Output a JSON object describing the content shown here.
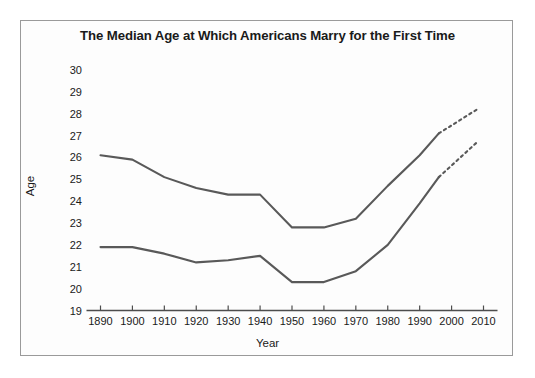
{
  "chart_data": {
    "type": "line",
    "title": "The Median Age at Which Americans Marry for the First Time",
    "xlabel": "Year",
    "ylabel": "Age",
    "xlim": [
      1890,
      2010
    ],
    "ylim": [
      19,
      30
    ],
    "xticks": [
      1890,
      1900,
      1910,
      1920,
      1930,
      1940,
      1950,
      1960,
      1970,
      1980,
      1990,
      2000,
      2010
    ],
    "yticks": [
      19,
      20,
      21,
      22,
      23,
      24,
      25,
      26,
      27,
      28,
      29,
      30
    ],
    "grid": false,
    "legend": "none",
    "line_color": "#595959",
    "series": [
      {
        "name": "men",
        "solid": {
          "x": [
            1890,
            1900,
            1910,
            1920,
            1930,
            1940,
            1950,
            1960,
            1970,
            1980,
            1990,
            1996
          ],
          "y": [
            26.1,
            25.9,
            25.1,
            24.6,
            24.3,
            24.3,
            22.8,
            22.8,
            23.2,
            24.7,
            26.1,
            27.1
          ]
        },
        "dashed": {
          "x": [
            1996,
            2008
          ],
          "y": [
            27.1,
            28.2
          ]
        }
      },
      {
        "name": "women",
        "solid": {
          "x": [
            1890,
            1900,
            1910,
            1920,
            1930,
            1940,
            1950,
            1960,
            1970,
            1980,
            1990,
            1996
          ],
          "y": [
            21.9,
            21.9,
            21.6,
            21.2,
            21.3,
            21.5,
            20.3,
            20.3,
            20.8,
            22.0,
            23.9,
            25.1
          ]
        },
        "dashed": {
          "x": [
            1996,
            2008
          ],
          "y": [
            25.1,
            26.7
          ]
        }
      }
    ]
  },
  "figure": {
    "title": "The Median Age at Which Americans Marry for the First Time",
    "x_axis_title": "Year",
    "y_axis_title": "Age"
  }
}
